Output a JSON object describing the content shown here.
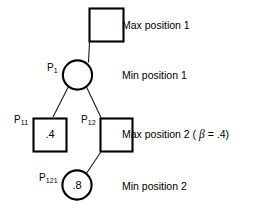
{
  "diagram": {
    "colors": {
      "stroke": "#000000",
      "background": "#ffffff",
      "text": "#000000"
    },
    "nodes": [
      {
        "id": "root",
        "shape": "square",
        "label": "",
        "label_sub": "",
        "value": "",
        "x": 89,
        "y": 8,
        "size": 35
      },
      {
        "id": "p1",
        "shape": "circle",
        "label": "P",
        "label_sub": "1",
        "value": "",
        "cx": 77.5,
        "cy": 75,
        "r": 15
      },
      {
        "id": "p11",
        "shape": "square",
        "label": "P",
        "label_sub": "11",
        "value": ".4",
        "x": 33,
        "y": 118,
        "size": 34
      },
      {
        "id": "p12",
        "shape": "square",
        "label": "P",
        "label_sub": "12",
        "value": "",
        "x": 100,
        "y": 118,
        "size": 34
      },
      {
        "id": "p121",
        "shape": "circle",
        "label": "P",
        "label_sub": "121",
        "value": ".8",
        "cx": 77,
        "cy": 185,
        "r": 15
      }
    ],
    "edges": [
      {
        "from": "root",
        "to": "p1"
      },
      {
        "from": "p1",
        "to": "p11"
      },
      {
        "from": "p1",
        "to": "p12"
      },
      {
        "from": "p12",
        "to": "p121"
      }
    ],
    "captions": [
      {
        "id": "caption-max-1",
        "text": "Max position 1",
        "x": 122,
        "y": 19
      },
      {
        "id": "caption-min-1",
        "text": "Min position 1",
        "x": 122,
        "y": 69
      },
      {
        "id": "caption-max-2",
        "text_before": "Max position 2 ( ",
        "symbol": "β",
        "text_after": " = .4)",
        "x": 122,
        "y": 128
      },
      {
        "id": "caption-min-2",
        "text": "Min position 2",
        "x": 122,
        "y": 180
      }
    ]
  }
}
